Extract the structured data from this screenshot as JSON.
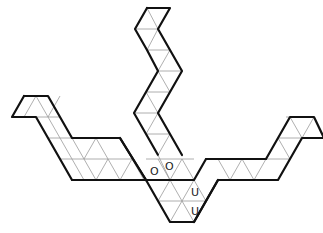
{
  "diagram": {
    "type": "triangle-grid-net",
    "outline": [
      [
        147,
        8
      ],
      [
        170,
        8
      ],
      [
        158,
        29
      ],
      [
        170,
        50
      ],
      [
        182,
        71
      ],
      [
        170,
        92
      ],
      [
        158,
        113
      ],
      [
        170,
        134
      ],
      [
        182,
        155
      ],
      [
        158,
        155
      ],
      [
        194,
        155
      ],
      [
        206,
        176
      ],
      [
        218,
        176
      ],
      [
        242,
        176
      ],
      [
        266,
        176
      ],
      [
        278,
        155
      ],
      [
        290,
        134
      ],
      [
        285,
        117
      ],
      [
        307,
        117
      ],
      [
        318,
        138
      ],
      [
        296,
        138
      ],
      [
        284,
        159
      ],
      [
        272,
        180
      ],
      [
        266,
        180
      ],
      [
        206,
        180
      ],
      [
        182,
        222
      ],
      [
        158,
        222
      ],
      [
        146,
        201
      ],
      [
        134,
        180
      ],
      [
        110,
        180
      ],
      [
        86,
        180
      ],
      [
        60,
        180
      ],
      [
        48,
        159
      ],
      [
        36,
        138
      ],
      [
        24,
        117
      ],
      [
        12,
        117
      ],
      [
        24,
        96
      ],
      [
        48,
        96
      ],
      [
        60,
        117
      ],
      [
        72,
        138
      ],
      [
        96,
        138
      ],
      [
        120,
        138
      ],
      [
        146,
        180
      ],
      [
        158,
        159
      ],
      [
        146,
        138
      ],
      [
        134,
        113
      ],
      [
        146,
        92
      ],
      [
        158,
        71
      ],
      [
        146,
        50
      ],
      [
        134,
        29
      ],
      [
        147,
        8
      ]
    ],
    "labels": [
      {
        "text": "O",
        "x": 152,
        "y": 168
      },
      {
        "text": "O",
        "x": 166,
        "y": 163
      },
      {
        "text": "U",
        "x": 192,
        "y": 188
      },
      {
        "text": "U",
        "x": 192,
        "y": 208
      }
    ]
  }
}
